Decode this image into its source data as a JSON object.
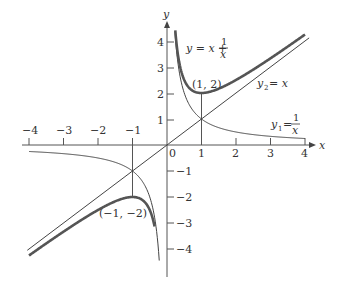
{
  "chart_data": {
    "type": "line",
    "title": "",
    "xlabel": "x",
    "ylabel": "y",
    "xlim": [
      -4,
      4
    ],
    "ylim": [
      -4.5,
      4.5
    ],
    "grid": false,
    "x_ticks": [
      "−4",
      "−3",
      "−2",
      "−1",
      "0",
      "1",
      "2",
      "3",
      "4"
    ],
    "y_ticks_positive": [
      "1",
      "2",
      "3",
      "4"
    ],
    "y_ticks_negative": [
      "−1",
      "−2",
      "−3",
      "−4"
    ],
    "series": [
      {
        "name": "y1 = 1/x",
        "style": "thin",
        "formula": "1/x"
      },
      {
        "name": "y2 = x",
        "style": "thin",
        "formula": "x"
      },
      {
        "name": "y = x + 1/x",
        "style": "thick",
        "formula": "x + 1/x"
      }
    ],
    "annotations": [
      {
        "text": "(1, 2)",
        "x": 1,
        "y": 2,
        "note": "local minimum of y = x + 1/x"
      },
      {
        "text": "(−1, −2)",
        "x": -1,
        "y": -2,
        "note": "local maximum of y = x + 1/x"
      }
    ],
    "reference_lines": [
      {
        "x": 1,
        "from_y": 0,
        "to_y": 2
      },
      {
        "x": -1,
        "from_y": 0,
        "to_y": -2
      }
    ]
  },
  "labels": {
    "x_axis": "x",
    "y_axis": "y",
    "origin": "0",
    "sum_label_prefix": "y = x +",
    "sum_label_num": "1",
    "sum_label_den": "x",
    "y2_label_y": "y",
    "y2_label_sub": "2",
    "y2_label_rhs": "= x",
    "y1_label_y": "y",
    "y1_label_sub": "1",
    "y1_label_eq": "=",
    "y1_label_num": "1",
    "y1_label_den": "x",
    "point_max": "(1, 2)",
    "point_min": "(−1, −2)"
  }
}
